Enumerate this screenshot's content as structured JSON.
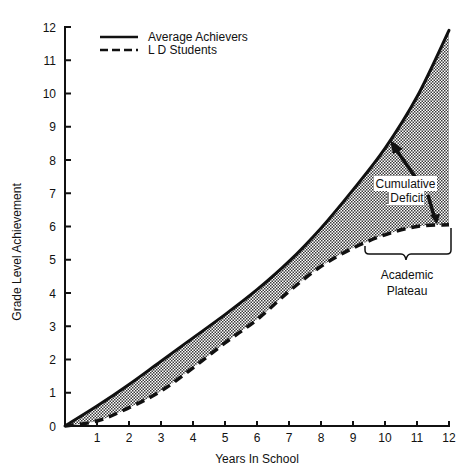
{
  "chart_data": {
    "type": "line",
    "title": "",
    "xlabel": "Years In School",
    "ylabel": "Grade Level Achievement",
    "xlim": [
      0,
      12
    ],
    "ylim": [
      0,
      12
    ],
    "grid": false,
    "legend_position": "top-left",
    "x": [
      0,
      1,
      2,
      3,
      4,
      5,
      6,
      7,
      8,
      9,
      10,
      11,
      12
    ],
    "x_tick_labels": [
      "1",
      "2",
      "3",
      "4",
      "5",
      "6",
      "7",
      "8",
      "9",
      "10",
      "11",
      "12"
    ],
    "y_tick_labels": [
      "0",
      "1",
      "2",
      "3",
      "4",
      "5",
      "6",
      "7",
      "8",
      "9",
      "10",
      "11",
      "12"
    ],
    "series": [
      {
        "name": "Average Achievers",
        "style": "solid",
        "values": [
          0,
          0.6,
          1.25,
          1.95,
          2.65,
          3.35,
          4.1,
          4.95,
          5.95,
          7.1,
          8.35,
          9.9,
          11.9
        ]
      },
      {
        "name": "L D Students",
        "style": "dashed",
        "values": [
          0,
          0.15,
          0.55,
          1.05,
          1.75,
          2.5,
          3.2,
          4.05,
          4.8,
          5.35,
          5.75,
          6.0,
          6.05
        ]
      }
    ],
    "shaded_region": {
      "between": [
        "Average Achievers",
        "L D Students"
      ],
      "fill": "stippled gray"
    },
    "annotations": [
      {
        "text_lines": [
          "Cumulative",
          "Deficit"
        ],
        "at_x": 11,
        "description": "Arrows point to the Average Achievers curve and the L D Students curve, marking the gap between them"
      },
      {
        "text_lines": [
          "Academic",
          "Plateau"
        ],
        "x_range": [
          9.4,
          12
        ],
        "description": "Brace under the flattened L D Students curve from about year 9.4 to 12"
      }
    ]
  },
  "legend": {
    "items": [
      {
        "label": "Average Achievers",
        "style": "solid"
      },
      {
        "label": "L D Students",
        "style": "dashed"
      }
    ]
  },
  "annotations": {
    "deficit_line1": "Cumulative",
    "deficit_line2": "Deficit",
    "plateau_line1": "Academic",
    "plateau_line2": "Plateau"
  },
  "axes": {
    "xlabel": "Years In School",
    "ylabel": "Grade Level Achievement"
  },
  "colors": {
    "ink": "#111111",
    "fill_dot": "#3a3a3a",
    "background": "#ffffff"
  }
}
